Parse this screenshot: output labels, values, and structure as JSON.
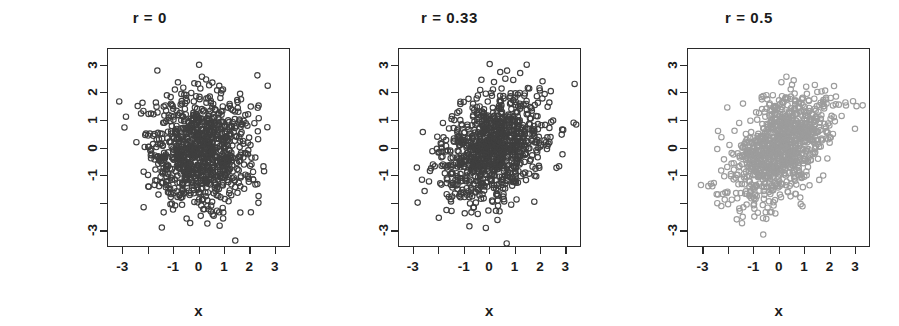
{
  "figure": {
    "width": 899,
    "height": 326,
    "background": "#ffffff",
    "panel_count": 3
  },
  "chart_data": [
    {
      "type": "scatter",
      "title": "r = 0",
      "xlabel": "x",
      "ylabel": "z, uncorrelated",
      "correlation": 0,
      "n_points": 1000,
      "marker": "open-circle",
      "marker_color": "#3f3f3f",
      "marker_radius": 2.7,
      "xlim": [
        -3.6,
        3.6
      ],
      "ylim": [
        -3.6,
        3.6
      ],
      "grid": false,
      "legend": null,
      "xticks": [
        -3,
        -2,
        -1,
        0,
        1,
        2,
        3
      ],
      "xticklabels": [
        "-3",
        "",
        "-1",
        "0",
        "1",
        "2",
        "3"
      ],
      "yticks": [
        -3,
        -2,
        -1,
        0,
        1,
        2,
        3
      ],
      "yticklabels": [
        "-3",
        "",
        "-1",
        "0",
        "1",
        "2",
        "3"
      ],
      "seed": 17
    },
    {
      "type": "scatter",
      "title": "r = 0.33",
      "xlabel": "x",
      "ylabel": "z, weakly correlated",
      "correlation": 0.33,
      "n_points": 1000,
      "marker": "open-circle",
      "marker_color": "#3f3f3f",
      "marker_radius": 2.7,
      "xlim": [
        -3.6,
        3.6
      ],
      "ylim": [
        -3.6,
        3.6
      ],
      "grid": false,
      "legend": null,
      "xticks": [
        -3,
        -2,
        -1,
        0,
        1,
        2,
        3
      ],
      "xticklabels": [
        "-3",
        "",
        "-1",
        "0",
        "1",
        "2",
        "3"
      ],
      "yticks": [
        -3,
        -2,
        -1,
        0,
        1,
        2,
        3
      ],
      "yticklabels": [
        "-3",
        "",
        "-1",
        "0",
        "1",
        "2",
        "3"
      ],
      "seed": 43
    },
    {
      "type": "scatter",
      "title": "r = 0.5",
      "xlabel": "x",
      "ylabel": "z, moderately correlated",
      "correlation": 0.5,
      "n_points": 1000,
      "marker": "open-circle",
      "marker_color": "#9c9c9c",
      "marker_radius": 2.7,
      "xlim": [
        -3.6,
        3.6
      ],
      "ylim": [
        -3.6,
        3.6
      ],
      "grid": false,
      "legend": null,
      "xticks": [
        -3,
        -2,
        -1,
        0,
        1,
        2,
        3
      ],
      "xticklabels": [
        "-3",
        "",
        "-1",
        "0",
        "1",
        "2",
        "3"
      ],
      "yticks": [
        -3,
        -2,
        -1,
        0,
        1,
        2,
        3
      ],
      "yticklabels": [
        "-3",
        "",
        "-1",
        "0",
        "1",
        "2",
        "3"
      ],
      "seed": 91
    }
  ],
  "panel_geometry": [
    {
      "left": 107,
      "top": 48,
      "width": 183,
      "height": 199
    },
    {
      "left": 98,
      "top": 48,
      "width": 183,
      "height": 199
    },
    {
      "left": 88,
      "top": 48,
      "width": 183,
      "height": 199
    }
  ],
  "style": {
    "axis_color": "#2a2a2a",
    "text_color": "#1b1b1b",
    "tick_length": 7
  }
}
